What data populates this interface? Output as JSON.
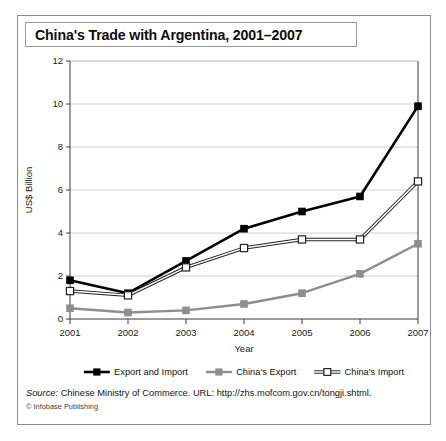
{
  "figure": {
    "title": "China's Trade with Argentina, 2001–2007",
    "source_prefix": "Source:",
    "source_text": " Chinese Ministry of Commerce. URL: http://zhs.mofcom.gov.cn/tongji.shtml.",
    "credit": "© Infobase Publishing"
  },
  "chart_data": {
    "type": "line",
    "title": "China's Trade with Argentina, 2001–2007",
    "xlabel": "Year",
    "ylabel": "US$ Billion",
    "categories": [
      "2001",
      "2002",
      "2003",
      "2004",
      "2005",
      "2006",
      "2007"
    ],
    "x": [
      2001,
      2002,
      2003,
      2004,
      2005,
      2006,
      2007
    ],
    "xlim": [
      2001,
      2007
    ],
    "ylim": [
      0,
      12
    ],
    "yticks": [
      0,
      2,
      4,
      6,
      8,
      10,
      12
    ],
    "grid": "horizontal",
    "legend_position": "below",
    "series": [
      {
        "name": "Export and Import",
        "values": [
          1.8,
          1.2,
          2.7,
          4.2,
          5.0,
          5.7,
          9.9
        ],
        "color": "#000000",
        "marker": "filled-square",
        "line_style": "single",
        "line_width": 2.6
      },
      {
        "name": "China's Export",
        "values": [
          0.5,
          0.3,
          0.4,
          0.7,
          1.2,
          2.1,
          3.5
        ],
        "color": "#8e8e8e",
        "marker": "filled-square",
        "line_style": "single",
        "line_width": 2.4
      },
      {
        "name": "China's Import",
        "values": [
          1.3,
          1.1,
          2.4,
          3.3,
          3.7,
          3.7,
          6.4
        ],
        "color": "#222222",
        "marker": "open-square",
        "line_style": "double",
        "line_width": 1.0
      }
    ]
  }
}
